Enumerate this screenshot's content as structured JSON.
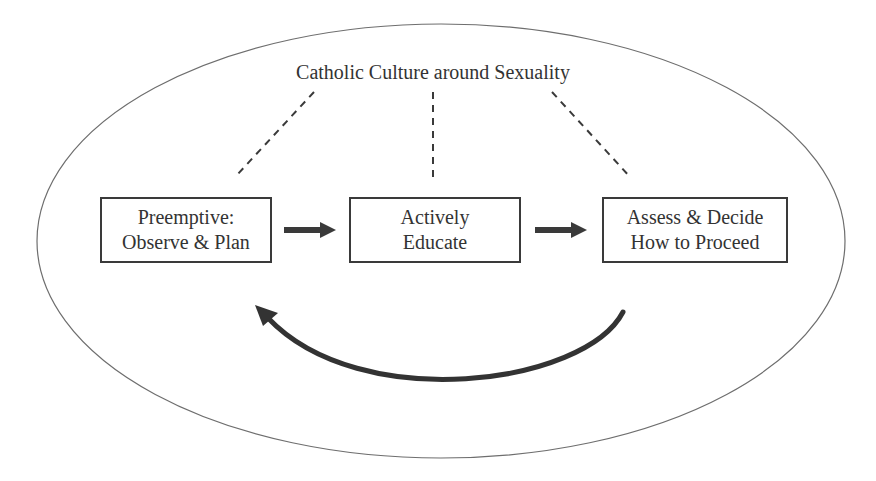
{
  "diagram": {
    "type": "cycle-within-context",
    "context": {
      "label": "Catholic Culture around Sexuality",
      "shape": "ellipse",
      "connector_style": "dashed"
    },
    "steps": [
      {
        "id": "step1",
        "line1": "Preemptive:",
        "line2": "Observe & Plan"
      },
      {
        "id": "step2",
        "line1": "Actively",
        "line2": "Educate"
      },
      {
        "id": "step3",
        "line1": "Assess & Decide",
        "line2": "How to Proceed"
      }
    ],
    "edges": [
      {
        "from": "step1",
        "to": "step2",
        "style": "solid-thick-arrow"
      },
      {
        "from": "step2",
        "to": "step3",
        "style": "solid-thick-arrow"
      },
      {
        "from": "step3",
        "to": "step1",
        "style": "curved-feedback-arrow"
      }
    ],
    "colors": {
      "line": "#3a3a3a",
      "ellipse": "#6e6e6e",
      "text": "#333333",
      "background": "#ffffff"
    }
  }
}
